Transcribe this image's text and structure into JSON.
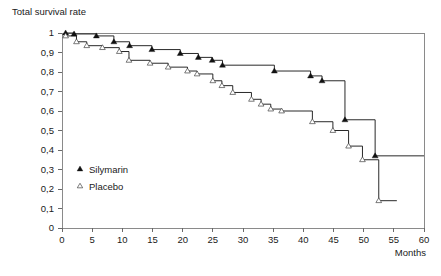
{
  "chart_data": {
    "type": "line",
    "subtype": "kaplan-meier-step",
    "title": "Total survival rate",
    "xlabel": "Months",
    "ylabel": "Total survival rate",
    "xlim": [
      0,
      60
    ],
    "ylim": [
      0,
      1
    ],
    "grid": false,
    "legend_position": "inside-left-lower",
    "x_ticks": [
      0,
      5,
      10,
      15,
      20,
      25,
      30,
      35,
      40,
      45,
      50,
      55,
      60
    ],
    "x_tick_labels": [
      "0",
      "5",
      "10",
      "15",
      "20",
      "25",
      "30",
      "35",
      "40",
      "45",
      "50",
      "55",
      "60"
    ],
    "y_ticks": [
      0,
      0.1,
      0.2,
      0.3,
      0.4,
      0.5,
      0.6,
      0.7,
      0.8,
      0.9,
      1
    ],
    "y_tick_labels": [
      "0",
      "0,1",
      "0,2",
      "0,3",
      "0,4",
      "0,5",
      "0,6",
      "0,7",
      "0,8",
      "0,9",
      "1"
    ],
    "series": [
      {
        "name": "Silymarin",
        "marker": "filled-triangle",
        "color": "#111111",
        "points": [
          {
            "x": 0.6,
            "y": 1.0
          },
          {
            "x": 2.0,
            "y": 0.995
          },
          {
            "x": 5.7,
            "y": 0.985
          },
          {
            "x": 8.6,
            "y": 0.955
          },
          {
            "x": 11.2,
            "y": 0.935
          },
          {
            "x": 14.9,
            "y": 0.915
          },
          {
            "x": 19.6,
            "y": 0.895
          },
          {
            "x": 22.6,
            "y": 0.875
          },
          {
            "x": 24.9,
            "y": 0.86
          },
          {
            "x": 26.6,
            "y": 0.835
          },
          {
            "x": 35.2,
            "y": 0.805
          },
          {
            "x": 41.2,
            "y": 0.78
          },
          {
            "x": 43.1,
            "y": 0.755
          },
          {
            "x": 46.9,
            "y": 0.555
          },
          {
            "x": 51.9,
            "y": 0.37
          },
          {
            "x": 60.0,
            "y": 0.37
          }
        ]
      },
      {
        "name": "Placebo",
        "marker": "open-triangle",
        "color": "#444444",
        "points": [
          {
            "x": 0.6,
            "y": 0.985
          },
          {
            "x": 2.4,
            "y": 0.955
          },
          {
            "x": 4.1,
            "y": 0.935
          },
          {
            "x": 6.7,
            "y": 0.925
          },
          {
            "x": 9.5,
            "y": 0.905
          },
          {
            "x": 11.1,
            "y": 0.86
          },
          {
            "x": 14.6,
            "y": 0.845
          },
          {
            "x": 17.6,
            "y": 0.825
          },
          {
            "x": 20.8,
            "y": 0.805
          },
          {
            "x": 22.4,
            "y": 0.79
          },
          {
            "x": 25.0,
            "y": 0.755
          },
          {
            "x": 26.5,
            "y": 0.73
          },
          {
            "x": 28.3,
            "y": 0.695
          },
          {
            "x": 31.4,
            "y": 0.66
          },
          {
            "x": 33.0,
            "y": 0.635
          },
          {
            "x": 34.6,
            "y": 0.61
          },
          {
            "x": 36.4,
            "y": 0.6
          },
          {
            "x": 41.5,
            "y": 0.545
          },
          {
            "x": 44.9,
            "y": 0.5
          },
          {
            "x": 47.5,
            "y": 0.42
          },
          {
            "x": 49.8,
            "y": 0.35
          },
          {
            "x": 52.5,
            "y": 0.14
          },
          {
            "x": 55.5,
            "y": 0.14
          }
        ]
      }
    ]
  },
  "legend": {
    "items": [
      {
        "label": "Silymarin",
        "marker": "filled-triangle"
      },
      {
        "label": "Placebo",
        "marker": "open-triangle"
      }
    ]
  }
}
